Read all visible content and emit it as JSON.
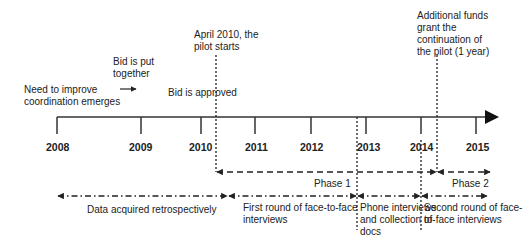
{
  "timeline": {
    "years": [
      "2008",
      "2009",
      "2010",
      "2011",
      "2012",
      "2013",
      "2014",
      "2015"
    ]
  },
  "events": {
    "need": [
      "Need to improve",
      "coordination emerges"
    ],
    "bid_put": [
      "Bid is put",
      "together"
    ],
    "bid_approved": "Bid is approved",
    "pilot_start": [
      "April 2010, the",
      "pilot starts"
    ],
    "funds": [
      "Additional funds",
      "grant the",
      "continuation of",
      "the pilot (1 year)"
    ]
  },
  "phases": {
    "phase1": "Phase 1",
    "phase2": "Phase 2"
  },
  "data_collection": {
    "retro": "Data acquired retrospectively",
    "first_round": [
      "First round of face-to-face",
      "interviews"
    ],
    "phone": [
      "Phone interviews",
      "and collection of",
      "docs"
    ],
    "second_round": [
      "Second round of face-",
      "to-face interviews"
    ]
  },
  "colors": {
    "line": "#222222",
    "background": "#ffffff"
  }
}
